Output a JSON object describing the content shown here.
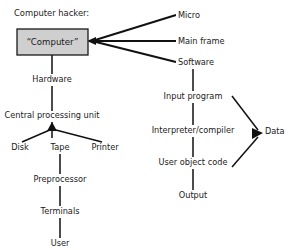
{
  "diagram": {
    "title": "Computer hacker:",
    "root_box": {
      "label": "“Computer”",
      "fill_color": "#cfcfcf",
      "border_color": "#1a1a1a"
    },
    "nodes": [
      {
        "id": "micro",
        "label": "Micro",
        "x": 178,
        "y": 18,
        "anchor": "start"
      },
      {
        "id": "mainframe",
        "label": "Main frame",
        "x": 178,
        "y": 44,
        "anchor": "start"
      },
      {
        "id": "software",
        "label": "Software",
        "x": 178,
        "y": 65,
        "anchor": "start"
      },
      {
        "id": "hardware",
        "label": "Hardware",
        "x": 52,
        "y": 82,
        "anchor": "middle"
      },
      {
        "id": "cpu",
        "label": "Central processing unit",
        "x": 52,
        "y": 118,
        "anchor": "middle"
      },
      {
        "id": "disk",
        "label": "Disk",
        "x": 20,
        "y": 150,
        "anchor": "middle"
      },
      {
        "id": "tape",
        "label": "Tape",
        "x": 60,
        "y": 150,
        "anchor": "middle"
      },
      {
        "id": "printer",
        "label": "Printer",
        "x": 105,
        "y": 150,
        "anchor": "middle"
      },
      {
        "id": "preprocessor",
        "label": "Preprocessor",
        "x": 60,
        "y": 182,
        "anchor": "middle"
      },
      {
        "id": "terminals",
        "label": "Terminals",
        "x": 60,
        "y": 214,
        "anchor": "middle"
      },
      {
        "id": "user",
        "label": "User",
        "x": 60,
        "y": 246,
        "anchor": "middle"
      },
      {
        "id": "inputprogram",
        "label": "Input program",
        "x": 193,
        "y": 99,
        "anchor": "middle"
      },
      {
        "id": "interpreter",
        "label": "Interpreter/compiler",
        "x": 193,
        "y": 133,
        "anchor": "middle"
      },
      {
        "id": "objectcode",
        "label": "User object code",
        "x": 193,
        "y": 165,
        "anchor": "middle"
      },
      {
        "id": "output",
        "label": "Output",
        "x": 193,
        "y": 198,
        "anchor": "middle"
      },
      {
        "id": "data",
        "label": "Data",
        "x": 268,
        "y": 134,
        "anchor": "middle"
      }
    ],
    "edges": [
      {
        "from": "computer",
        "to": "micro",
        "kind": "fan"
      },
      {
        "from": "computer",
        "to": "mainframe",
        "kind": "fan"
      },
      {
        "from": "computer",
        "to": "software",
        "kind": "fan"
      },
      {
        "from": "computer",
        "to": "hardware",
        "kind": "vertical"
      },
      {
        "from": "hardware",
        "to": "cpu",
        "kind": "vertical-arrow"
      },
      {
        "from": "cpu",
        "to": "disk",
        "kind": "branch"
      },
      {
        "from": "cpu",
        "to": "tape",
        "kind": "branch"
      },
      {
        "from": "cpu",
        "to": "printer",
        "kind": "branch"
      },
      {
        "from": "tape",
        "to": "preprocessor",
        "kind": "vertical"
      },
      {
        "from": "preprocessor",
        "to": "terminals",
        "kind": "vertical"
      },
      {
        "from": "terminals",
        "to": "user",
        "kind": "vertical"
      },
      {
        "from": "software",
        "to": "inputprogram",
        "kind": "vertical"
      },
      {
        "from": "inputprogram",
        "to": "interpreter",
        "kind": "vertical"
      },
      {
        "from": "interpreter",
        "to": "objectcode",
        "kind": "vertical"
      },
      {
        "from": "objectcode",
        "to": "output",
        "kind": "vertical"
      },
      {
        "from": "inputprogram",
        "to": "data",
        "kind": "diagonal-arrow"
      },
      {
        "from": "objectcode",
        "to": "data",
        "kind": "diagonal-arrow"
      }
    ]
  }
}
